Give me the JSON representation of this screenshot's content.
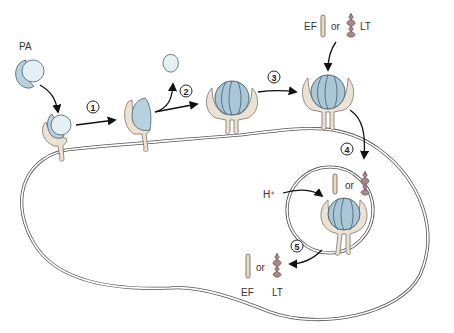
{
  "diagram": {
    "labels": {
      "pa": "PA",
      "ef_top": "EF",
      "or_top": "or",
      "lt_top": "LT",
      "or_endosome": "or",
      "proton": "H⁺",
      "or_bottom": "or",
      "ef_bottom": "EF",
      "lt_bottom": "LT"
    },
    "steps": [
      {
        "number": "1",
        "description": "PA binds receptor and is cleaved"
      },
      {
        "number": "2",
        "description": "PA20 fragment released"
      },
      {
        "number": "3",
        "description": "PA63 heptamer (prepore) forms"
      },
      {
        "number": "4",
        "description": "EF or LT binds; complex endocytosed"
      },
      {
        "number": "5",
        "description": "Acidification; EF or LT translocated to cytosol"
      }
    ],
    "components": [
      {
        "name": "PA",
        "role": "protective antigen"
      },
      {
        "name": "EF",
        "role": "edema factor",
        "shape": "rod"
      },
      {
        "name": "LT",
        "role": "lethal factor",
        "shape": "coil"
      },
      {
        "name": "receptor",
        "role": "cell-surface receptor"
      },
      {
        "name": "cell",
        "role": "host cell membrane"
      },
      {
        "name": "endosome",
        "role": "acidified vesicle"
      }
    ],
    "colors": {
      "membrane": "#555555",
      "receptor": "#ebe2d3",
      "pa": "#b7d1de",
      "pa_light": "#e4f0f4",
      "ef": "#e8dcc2",
      "lt": "#a88a8a",
      "arrow": "#111111"
    }
  }
}
